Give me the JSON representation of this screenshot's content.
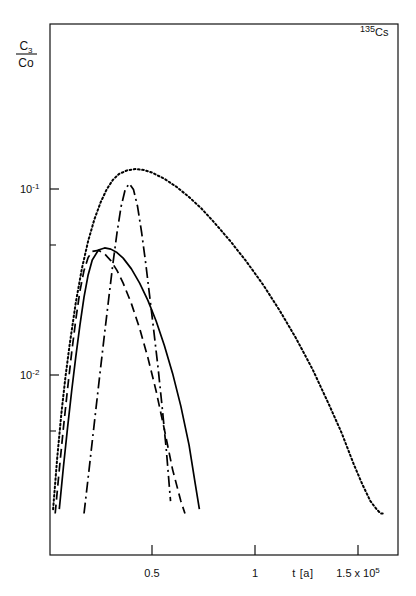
{
  "figure": {
    "isotope_label": {
      "mass_number": "135",
      "symbol": "Cs",
      "full": "135Cs"
    },
    "y_axis_label": {
      "numerator": "C",
      "numerator_sub": "3",
      "denominator": "Co"
    },
    "x_axis_title": "t [a]",
    "x_axis_exponent_label": "1.5 x 10",
    "x_axis_exponent_sup": "5"
  },
  "chart_data": {
    "type": "line",
    "title": "",
    "subtitle": "",
    "annotations": [
      {
        "text": "135Cs",
        "x_frac": 0.93,
        "y_frac": 0.04,
        "description": "isotope identifier, top-right inside frame"
      }
    ],
    "xlabel": "t [a]",
    "ylabel": "C3/Co",
    "xscale": "linear",
    "yscale": "log",
    "xlim": [
      0,
      170000
    ],
    "ylim": [
      0.0018,
      0.45
    ],
    "grid": false,
    "legend": "none",
    "x_ticks": [
      {
        "value": 50000,
        "label": "0.5"
      },
      {
        "value": 100000,
        "label": "1"
      },
      {
        "value": 150000,
        "label": "1.5 x 10^5"
      }
    ],
    "x_minor_ticks": [
      12500,
      25000,
      37500,
      62500,
      75000,
      87500,
      112500,
      125000,
      137500
    ],
    "y_ticks": [
      {
        "value": 0.1,
        "label": "10^-1"
      },
      {
        "value": 0.01,
        "label": "10^-2"
      }
    ],
    "y_minor_ticks": [
      0.05,
      0.005
    ],
    "series": [
      {
        "name": "dotted-curve",
        "style": "dotted",
        "color": "#000000",
        "peak_x": 34000,
        "peak_y": 0.31,
        "x": [
          2000,
          4000,
          6000,
          8000,
          10000,
          13000,
          16000,
          19000,
          22000,
          25000,
          28000,
          31000,
          34000,
          38000,
          42000,
          46000,
          50000,
          56000,
          62000,
          68000,
          74000,
          80000,
          88000,
          96000,
          104000,
          112000,
          120000,
          128000,
          136000,
          142000,
          148000,
          152000,
          156000,
          159000,
          161000,
          163000
        ],
        "y": [
          0.0019,
          0.0036,
          0.0062,
          0.0098,
          0.0145,
          0.0245,
          0.0375,
          0.0525,
          0.0685,
          0.0845,
          0.0995,
          0.112,
          0.1205,
          0.126,
          0.128,
          0.1265,
          0.1225,
          0.1135,
          0.1025,
          0.0905,
          0.0785,
          0.0665,
          0.0525,
          0.0405,
          0.0305,
          0.0222,
          0.0157,
          0.0107,
          0.0069,
          0.0049,
          0.0033,
          0.0026,
          0.0021,
          0.0019,
          0.0018,
          0.0018
        ]
      },
      {
        "name": "dash-dot-curve",
        "style": "dash-dot",
        "color": "#000000",
        "peak_x": 39000,
        "peak_y": 0.112,
        "x": [
          17000,
          19000,
          21000,
          23000,
          25000,
          27000,
          29000,
          31000,
          33000,
          35000,
          37000,
          39000,
          41000,
          43000,
          45000,
          47000,
          49000,
          51000,
          53000,
          55000,
          57000,
          59000
        ],
        "y": [
          0.0018,
          0.0028,
          0.0044,
          0.0069,
          0.0108,
          0.0168,
          0.0258,
          0.0395,
          0.058,
          0.0805,
          0.0995,
          0.107,
          0.0995,
          0.0805,
          0.058,
          0.0395,
          0.0258,
          0.0168,
          0.0108,
          0.0066,
          0.0039,
          0.0021
        ]
      },
      {
        "name": "solid-curve",
        "style": "solid",
        "color": "#000000",
        "peak_x": 28000,
        "peak_y": 0.048,
        "x": [
          5000,
          7000,
          9000,
          11000,
          13000,
          15000,
          17000,
          19000,
          21000,
          24000,
          27000,
          30000,
          33000,
          36000,
          40000,
          44000,
          48000,
          52000,
          56000,
          60000,
          64000,
          68000,
          71000,
          73000
        ],
        "y": [
          0.0019,
          0.0032,
          0.0052,
          0.0082,
          0.0125,
          0.0185,
          0.0262,
          0.0345,
          0.0415,
          0.047,
          0.0482,
          0.0475,
          0.0455,
          0.0425,
          0.0372,
          0.0312,
          0.0252,
          0.0195,
          0.0144,
          0.0102,
          0.0068,
          0.0042,
          0.0026,
          0.0019
        ]
      },
      {
        "name": "dashed-curve",
        "style": "dashed",
        "color": "#000000",
        "peak_x": 24000,
        "peak_y": 0.047,
        "x": [
          3000,
          5000,
          7000,
          9000,
          11000,
          13000,
          15000,
          17000,
          19000,
          21000,
          24000,
          27000,
          30000,
          33000,
          36000,
          40000,
          44000,
          48000,
          52000,
          56000,
          60000,
          64000,
          66000
        ],
        "y": [
          0.0018,
          0.0031,
          0.0052,
          0.0084,
          0.0132,
          0.0198,
          0.0282,
          0.0365,
          0.0428,
          0.0462,
          0.0468,
          0.0448,
          0.0412,
          0.0365,
          0.0312,
          0.0242,
          0.0178,
          0.0124,
          0.0082,
          0.0051,
          0.0031,
          0.0021,
          0.0018
        ]
      }
    ]
  }
}
